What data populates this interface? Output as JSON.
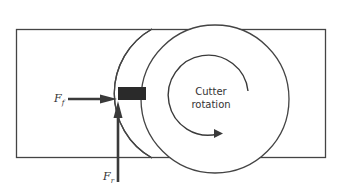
{
  "diagram": {
    "type": "milling-cutter-force-diagram",
    "labels": {
      "feed_force": {
        "symbol": "F",
        "subscript": "f"
      },
      "radial_force": {
        "symbol": "F",
        "subscript": "r"
      },
      "rotation_line1": "Cutter",
      "rotation_line2": "rotation"
    },
    "colors": {
      "stroke": "#444444",
      "tool": "#2a2a2a",
      "arrow": "#3a3a3a",
      "background": "#ffffff"
    }
  }
}
